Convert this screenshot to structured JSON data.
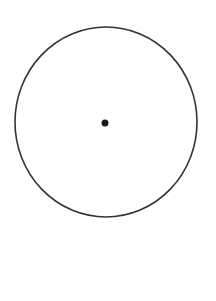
{
  "diagram": {
    "background": "#ffffff",
    "circle": {
      "cx": 106,
      "cy": 122,
      "rx": 91,
      "ry": 95,
      "stroke": "#333333",
      "stroke_width": 1.6,
      "fill": "none"
    },
    "center_point": {
      "cx": 105,
      "cy": 123,
      "r": 3.5,
      "fill": "#1a1a1a"
    }
  }
}
